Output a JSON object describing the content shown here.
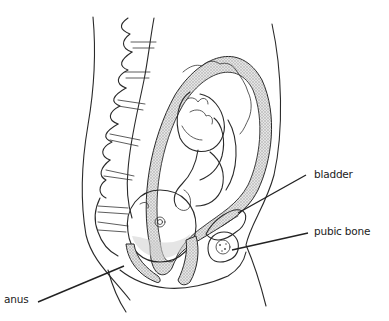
{
  "figure": {
    "colors": {
      "line": "#2a2a2a",
      "shading": "#bdbdbd",
      "background": "#ffffff"
    }
  },
  "labels": {
    "bladder": "bladder",
    "pubic_bone": "pubic bone",
    "anus": "anus"
  }
}
